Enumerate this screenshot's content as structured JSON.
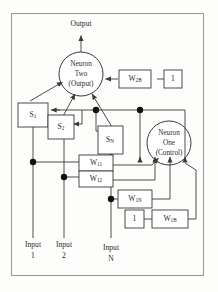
{
  "figure": {
    "type": "neural-network-architecture-diagram",
    "border_color": "#9a9a9a",
    "line_color": "#3a3a3a",
    "text_color": "#2b2b2b",
    "background": "#fdfdfc"
  },
  "output": {
    "label": "Output"
  },
  "neurons": [
    {
      "id": "neuron-two",
      "line1": "Neuron",
      "line2": "Two",
      "line3": "(Output)"
    },
    {
      "id": "neuron-one",
      "line1": "Neuron",
      "line2": "One",
      "line3": "(Control)"
    }
  ],
  "state_boxes": [
    {
      "id": "s1",
      "base": "S",
      "sub": "1"
    },
    {
      "id": "s2",
      "base": "S",
      "sub": "2"
    },
    {
      "id": "sn",
      "base": "S",
      "sub": "N"
    }
  ],
  "weight_boxes": [
    {
      "id": "w2b",
      "base": "W",
      "sub": "2B"
    },
    {
      "id": "w11",
      "base": "W",
      "sub": "11"
    },
    {
      "id": "w12",
      "base": "W",
      "sub": "12"
    },
    {
      "id": "w1n",
      "base": "W",
      "sub": "1N"
    },
    {
      "id": "w1b",
      "base": "W",
      "sub": "1B"
    }
  ],
  "bias_boxes": [
    {
      "id": "bias-top",
      "value": "1"
    },
    {
      "id": "bias-bottom",
      "value": "1"
    }
  ],
  "inputs": [
    {
      "id": "input-1",
      "line1": "Input",
      "line2": "1"
    },
    {
      "id": "input-2",
      "line1": "Input",
      "line2": "2"
    },
    {
      "id": "input-n",
      "line1": "Input",
      "line2": "N"
    }
  ]
}
